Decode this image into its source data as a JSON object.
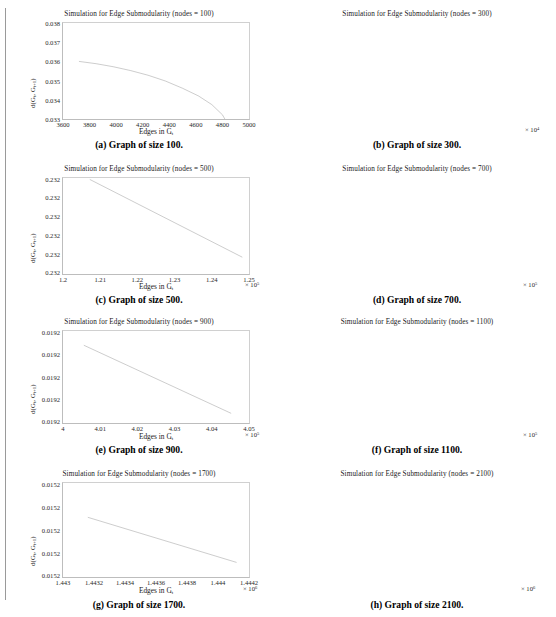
{
  "figure": {
    "panel_count": 8,
    "axis_labels": {
      "x": "Edges in G",
      "x_sub": "t",
      "y_prefix": "d(G",
      "y_sub1": "t",
      "y_mid": ", G",
      "y_sub2": "t+1",
      "y_suffix": ")"
    }
  },
  "chart_data": [
    {
      "type": "line",
      "title": "Simulation for Edge Submodularity (nodes = 100)",
      "caption": "(a) Graph of size 100.",
      "xlabel": "Edges in G_t",
      "ylabel": "d(G_t, G_t+1)",
      "nodes": 100,
      "xlim": [
        3600,
        5000
      ],
      "ylim": [
        0.033,
        0.038
      ],
      "xticks": [
        3600,
        3800,
        4000,
        4200,
        4400,
        4600,
        4800,
        5000
      ],
      "xtick_labels": [
        "3600",
        "3800",
        "4000",
        "4200",
        "4400",
        "4600",
        "4800",
        "5000"
      ],
      "yticks": [
        0.033,
        0.034,
        0.035,
        0.036,
        0.037,
        0.038
      ],
      "ytick_labels": [
        "0.033",
        "0.034",
        "0.035",
        "0.036",
        "0.037",
        "0.038"
      ],
      "x_exponent": "",
      "grid": false,
      "legend": false,
      "x": [
        3720,
        3850,
        3980,
        4110,
        4240,
        4370,
        4500,
        4620,
        4720,
        4800,
        4855
      ],
      "y": [
        0.036,
        0.03588,
        0.03572,
        0.03552,
        0.03528,
        0.03498,
        0.0346,
        0.0342,
        0.03375,
        0.03322,
        0.03255
      ]
    },
    {
      "type": "line",
      "title": "Simulation for Edge Submodularity (nodes = 300)",
      "caption": "(b) Graph of size 300.",
      "xlabel": "Edges in G_t",
      "ylabel": "d(G_t, G_t+1)",
      "nodes": 300,
      "xlim": [
        4.0,
        4.5
      ],
      "ylim": [
        0,
        1
      ],
      "xticks": [
        4.0,
        4.1,
        4.2,
        4.3,
        4.4,
        4.5
      ],
      "xtick_labels": [
        "4",
        "4.1",
        "4.2",
        "4.3",
        "4.4",
        "4.5"
      ],
      "ytick_labels": [
        "0.0265",
        "0.0265",
        "0.0265",
        "0.0265"
      ],
      "ytick_positions": [
        0.06,
        0.38,
        0.68,
        0.97
      ],
      "x_exponent": "× 10",
      "x_exponent_sup": "4",
      "grid": false,
      "legend": false,
      "x": [
        4.085,
        4.49
      ],
      "y": [
        0.655,
        0.165
      ]
    },
    {
      "type": "line",
      "title": "Simulation for Edge Submodularity (nodes = 500)",
      "caption": "(c) Graph of size 500.",
      "xlabel": "Edges in G_t",
      "ylabel": "d(G_t, G_t+1)",
      "nodes": 500,
      "xlim": [
        1.2,
        1.25
      ],
      "ylim": [
        0,
        1
      ],
      "xticks": [
        1.2,
        1.21,
        1.22,
        1.23,
        1.24,
        1.25
      ],
      "xtick_labels": [
        "1.2",
        "1.21",
        "1.22",
        "1.23",
        "1.24",
        "1.25"
      ],
      "ytick_labels": [
        "0.232",
        "0.232",
        "0.232",
        "0.232",
        "0.232",
        "0.232"
      ],
      "ytick_positions": [
        0.02,
        0.21,
        0.41,
        0.6,
        0.8,
        0.99
      ],
      "x_exponent": "× 10",
      "x_exponent_sup": "5",
      "grid": false,
      "legend": false,
      "x": [
        1.2072,
        1.2482
      ],
      "y": [
        0.985,
        0.175
      ]
    },
    {
      "type": "line",
      "title": "Simulation for Edge Submodularity (nodes = 700)",
      "caption": "(d) Graph of size 700.",
      "xlabel": "Edges in G_t",
      "ylabel": "d(G_t, G_t+1)",
      "nodes": 700,
      "xlim": [
        2.4,
        2.45
      ],
      "ylim": [
        0,
        1
      ],
      "xticks": [
        2.4,
        2.41,
        2.42,
        2.43,
        2.44,
        2.45
      ],
      "xtick_labels": [
        "2.4",
        "2.41",
        "2.42",
        "2.43",
        "2.44",
        "2.45"
      ],
      "ytick_labels": [
        "0.0209",
        "0.0209",
        "0.0209",
        "0.0209",
        "0.0209",
        "0.0209"
      ],
      "ytick_positions": [
        0.02,
        0.21,
        0.41,
        0.6,
        0.8,
        0.99
      ],
      "x_exponent": "× 10",
      "x_exponent_sup": "5",
      "grid": false,
      "legend": false,
      "x": [
        2.4068,
        2.4465
      ],
      "y": [
        0.875,
        0.135
      ]
    },
    {
      "type": "line",
      "title": "Simulation for Edge Submodularity (nodes = 900)",
      "caption": "(e) Graph of size 900.",
      "xlabel": "Edges in G_t",
      "ylabel": "d(G_t, G_t+1)",
      "nodes": 900,
      "xlim": [
        4.0,
        4.05
      ],
      "ylim": [
        0,
        1
      ],
      "xticks": [
        4.0,
        4.01,
        4.02,
        4.03,
        4.04,
        4.05
      ],
      "xtick_labels": [
        "4",
        "4.01",
        "4.02",
        "4.03",
        "4.04",
        "4.05"
      ],
      "ytick_labels": [
        "0.0192",
        "0.0192",
        "0.0192",
        "0.0192",
        "0.0192"
      ],
      "ytick_positions": [
        0.02,
        0.26,
        0.5,
        0.75,
        0.99
      ],
      "x_exponent": "× 10",
      "x_exponent_sup": "5",
      "grid": false,
      "legend": false,
      "x": [
        4.0056,
        4.0452
      ],
      "y": [
        0.845,
        0.105
      ]
    },
    {
      "type": "line",
      "title": "Simulation for Edge Submodularity (nodes = 1100)",
      "caption": "(f) Graph of size 1100.",
      "xlabel": "Edges in G_t",
      "ylabel": "d(G_t, G_t+1)",
      "nodes": 1100,
      "xlim": [
        6.0,
        6.05
      ],
      "ylim": [
        0,
        1
      ],
      "xticks": [
        6.0,
        6.01,
        6.02,
        6.03,
        6.04,
        6.05
      ],
      "xtick_labels": [
        "6",
        "6.01",
        "6.02",
        "6.03",
        "6.04",
        "6.05"
      ],
      "ytick_labels": [
        "0.0179",
        "0.0179",
        "0.0179",
        "0.0179"
      ],
      "ytick_positions": [
        0.02,
        0.335,
        0.655,
        0.99
      ],
      "x_exponent": "× 10",
      "x_exponent_sup": "5",
      "grid": false,
      "legend": false,
      "x": [
        6.0036,
        6.0452
      ],
      "y": [
        0.985,
        0.065
      ]
    },
    {
      "type": "line",
      "title": "Simulation for Edge Submodularity (nodes = 1700)",
      "caption": "(g) Graph of size 1700.",
      "xlabel": "Edges in G_t",
      "ylabel": "d(G_t, G_t+1)",
      "nodes": 1700,
      "xlim": [
        1.443,
        1.4442
      ],
      "ylim": [
        0,
        1
      ],
      "xticks": [
        1.443,
        1.4432,
        1.4434,
        1.4436,
        1.4438,
        1.444,
        1.4442
      ],
      "xtick_labels": [
        "1.443",
        "1.4432",
        "1.4434",
        "1.4436",
        "1.4438",
        "1.444",
        "1.4442"
      ],
      "ytick_labels": [
        "0.0152",
        "0.0152",
        "0.0152",
        "0.0152",
        "0.0152"
      ],
      "ytick_positions": [
        0.02,
        0.26,
        0.5,
        0.75,
        0.99
      ],
      "x_exponent": "× 10",
      "x_exponent_sup": "6",
      "grid": false,
      "legend": false,
      "x": [
        1.44316,
        1.44412
      ],
      "y": [
        0.635,
        0.155
      ]
    },
    {
      "type": "line",
      "title": "Simulation for Edge Submodularity (nodes = 2100)",
      "caption": "(h) Graph of size 2100.",
      "xlabel": "Edges in G_t",
      "ylabel": "d(G_t, G_t+1)",
      "nodes": 2100,
      "xlim": [
        2.2028,
        2.204
      ],
      "ylim": [
        0,
        1
      ],
      "xticks": [
        2.2028,
        2.203,
        2.2032,
        2.2034,
        2.2036,
        2.2038,
        2.204
      ],
      "xtick_labels": [
        "2.2028",
        "2.203",
        "2.2032",
        "2.2034",
        "2.2036",
        "2.2038",
        "2.204"
      ],
      "ytick_labels": [
        "0.014",
        "0.014",
        "0.014",
        "0.014"
      ],
      "ytick_positions": [
        0.02,
        0.335,
        0.655,
        0.99
      ],
      "x_exponent": "× 10",
      "x_exponent_sup": "6",
      "grid": false,
      "legend": false,
      "x": [
        2.20294,
        2.20396
      ],
      "y": [
        0.955,
        0.115
      ]
    }
  ]
}
